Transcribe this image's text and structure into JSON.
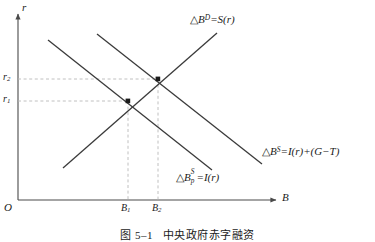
{
  "figure": {
    "background": "#ffffff",
    "line_color": "#3a3a3a",
    "dash_color": "#b9b9b9",
    "axis_color": "#4a4a4a"
  },
  "axes": {
    "y_label": "r",
    "x_label": "B",
    "origin_label": "O",
    "y_ticks": [
      {
        "label_base": "r",
        "label_sub": "2",
        "value": 79
      },
      {
        "label_base": "r",
        "label_sub": "1",
        "value": 101
      }
    ],
    "x_ticks": [
      {
        "label_base": "B",
        "label_sub": "1",
        "value": 128
      },
      {
        "label_base": "B",
        "label_sub": "2",
        "value": 158
      }
    ]
  },
  "curves": [
    {
      "name": "demand-savings",
      "label_delta": "△",
      "label_base": "B",
      "label_sup": "D",
      "label_rest": "=S(r)",
      "slope": "upward",
      "x1": 63,
      "y1": 168,
      "x2": 217,
      "y2": 33
    },
    {
      "name": "private-bond-supply",
      "label_delta": "△",
      "label_base": "B",
      "label_sup": "S",
      "label_sub": "p",
      "label_rest": "=I(r)",
      "slope": "downward",
      "x1": 48,
      "y1": 40,
      "x2": 212,
      "y2": 170
    },
    {
      "name": "total-bond-supply",
      "label_delta": "△",
      "label_base": "B",
      "label_sup": "S",
      "label_rest": "=I(r)+(G−T)",
      "slope": "downward",
      "x1": 97,
      "y1": 34,
      "x2": 262,
      "y2": 164
    }
  ],
  "equilibria": [
    {
      "name": "equilibrium-1",
      "x": 128,
      "y": 101
    },
    {
      "name": "equilibrium-2",
      "x": 158,
      "y": 79
    }
  ],
  "caption": "图 5–1   中央政府赤字融资"
}
